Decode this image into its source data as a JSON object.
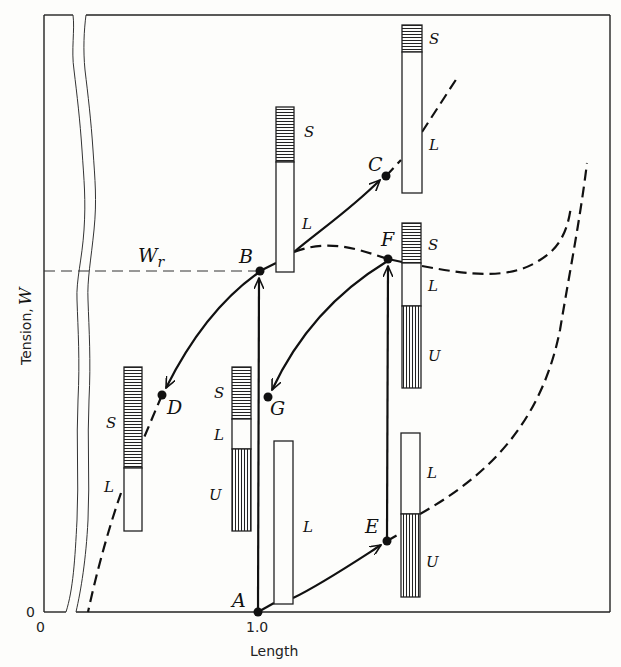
{
  "figure": {
    "type": "tension-length diagram",
    "axes": {
      "ylabel_text": "Tension, ",
      "ylabel_var": "W",
      "xlabel": "Length",
      "x_ticks": [
        "0",
        "1.0"
      ],
      "y_ticks": [
        "0"
      ]
    },
    "reference_line": {
      "label_main": "W",
      "label_sub": "r",
      "style": "dashed"
    },
    "points": [
      {
        "id": "A",
        "label": "A"
      },
      {
        "id": "B",
        "label": "B"
      },
      {
        "id": "C",
        "label": "C"
      },
      {
        "id": "D",
        "label": "D"
      },
      {
        "id": "E",
        "label": "E"
      },
      {
        "id": "F",
        "label": "F"
      },
      {
        "id": "G",
        "label": "G"
      }
    ],
    "bars": {
      "C": {
        "segments": [
          "S",
          "L"
        ]
      },
      "B": {
        "segments": [
          "S",
          "L"
        ]
      },
      "F": {
        "segments": [
          "S",
          "L",
          "U"
        ]
      },
      "E": {
        "segments": [
          "L",
          "U"
        ]
      },
      "D": {
        "segments": [
          "S",
          "L"
        ]
      },
      "G": {
        "segments": [
          "S",
          "L",
          "U"
        ]
      },
      "A": {
        "segments": [
          "L"
        ]
      }
    },
    "paths": [
      {
        "from": "A",
        "to": "B",
        "style": "solid-arrow"
      },
      {
        "from": "A",
        "to": "E",
        "style": "solid-arrow"
      },
      {
        "from": "E",
        "to": "F",
        "style": "solid-arrow"
      },
      {
        "from": "B",
        "to": "C",
        "style": "solid-arrow"
      },
      {
        "from": "B",
        "to": "D",
        "style": "solid-arrow"
      },
      {
        "from": "F",
        "to": "G",
        "style": "solid-arrow"
      },
      {
        "from": "B",
        "to": "F",
        "style": "dashed"
      }
    ],
    "legend_letters": {
      "S": "S",
      "L": "L",
      "U": "U"
    }
  }
}
